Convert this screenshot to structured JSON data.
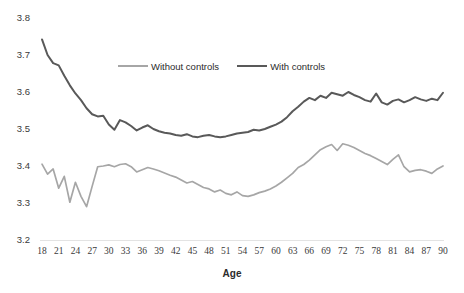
{
  "chart_data": {
    "type": "line",
    "title": "",
    "xlabel": "Age",
    "ylabel": "",
    "xlim": [
      18,
      90
    ],
    "ylim": [
      3.2,
      3.8
    ],
    "grid": false,
    "legend_position": "top-center",
    "ytick_labels": [
      "3.8",
      "3.7",
      "3.6",
      "3.5",
      "3.4",
      "3.3",
      "3.2"
    ],
    "ytick_values": [
      3.8,
      3.7,
      3.6,
      3.5,
      3.4,
      3.3,
      3.2
    ],
    "xtick_labels": [
      "18",
      "21",
      "24",
      "27",
      "30",
      "33",
      "36",
      "39",
      "42",
      "45",
      "48",
      "51",
      "54",
      "57",
      "60",
      "63",
      "66",
      "69",
      "72",
      "75",
      "78",
      "81",
      "84",
      "87",
      "90"
    ],
    "xtick_values": [
      18,
      21,
      24,
      27,
      30,
      33,
      36,
      39,
      42,
      45,
      48,
      51,
      54,
      57,
      60,
      63,
      66,
      69,
      72,
      75,
      78,
      81,
      84,
      87,
      90
    ],
    "x": [
      18,
      19,
      20,
      21,
      22,
      23,
      24,
      25,
      26,
      27,
      28,
      29,
      30,
      31,
      32,
      33,
      34,
      35,
      36,
      37,
      38,
      39,
      40,
      41,
      42,
      43,
      44,
      45,
      46,
      47,
      48,
      49,
      50,
      51,
      52,
      53,
      54,
      55,
      56,
      57,
      58,
      59,
      60,
      61,
      62,
      63,
      64,
      65,
      66,
      67,
      68,
      69,
      70,
      71,
      72,
      73,
      74,
      75,
      76,
      77,
      78,
      79,
      80,
      81,
      82,
      83,
      84,
      85,
      86,
      87,
      88,
      89,
      90
    ],
    "series": [
      {
        "name": "Without controls",
        "color": "#a6a6a6",
        "values": [
          3.405,
          3.378,
          3.392,
          3.34,
          3.372,
          3.302,
          3.356,
          3.318,
          3.29,
          3.345,
          3.398,
          3.4,
          3.403,
          3.398,
          3.404,
          3.406,
          3.398,
          3.384,
          3.39,
          3.396,
          3.392,
          3.387,
          3.381,
          3.375,
          3.37,
          3.362,
          3.354,
          3.358,
          3.35,
          3.342,
          3.338,
          3.33,
          3.335,
          3.326,
          3.322,
          3.33,
          3.32,
          3.318,
          3.322,
          3.328,
          3.332,
          3.338,
          3.346,
          3.356,
          3.368,
          3.38,
          3.396,
          3.404,
          3.416,
          3.43,
          3.444,
          3.452,
          3.458,
          3.442,
          3.46,
          3.456,
          3.45,
          3.442,
          3.434,
          3.428,
          3.42,
          3.412,
          3.404,
          3.418,
          3.43,
          3.398,
          3.384,
          3.388,
          3.39,
          3.386,
          3.38,
          3.392,
          3.4
        ]
      },
      {
        "name": "With controls",
        "color": "#595959",
        "values": [
          3.742,
          3.7,
          3.678,
          3.672,
          3.644,
          3.618,
          3.596,
          3.578,
          3.556,
          3.54,
          3.534,
          3.536,
          3.512,
          3.498,
          3.524,
          3.518,
          3.508,
          3.496,
          3.504,
          3.51,
          3.5,
          3.494,
          3.49,
          3.488,
          3.484,
          3.482,
          3.486,
          3.48,
          3.478,
          3.482,
          3.484,
          3.48,
          3.478,
          3.48,
          3.484,
          3.488,
          3.49,
          3.492,
          3.498,
          3.496,
          3.5,
          3.506,
          3.512,
          3.52,
          3.532,
          3.548,
          3.56,
          3.574,
          3.584,
          3.578,
          3.59,
          3.584,
          3.598,
          3.594,
          3.59,
          3.6,
          3.592,
          3.586,
          3.578,
          3.574,
          3.596,
          3.572,
          3.566,
          3.576,
          3.58,
          3.572,
          3.578,
          3.586,
          3.58,
          3.576,
          3.582,
          3.578,
          3.598
        ]
      }
    ],
    "legend": [
      {
        "label": "Without controls",
        "color": "#a6a6a6"
      },
      {
        "label": "With controls",
        "color": "#595959"
      }
    ]
  },
  "legend": {
    "without_controls": "Without controls",
    "with_controls": "With controls"
  },
  "axis": {
    "x_title": "Age"
  }
}
